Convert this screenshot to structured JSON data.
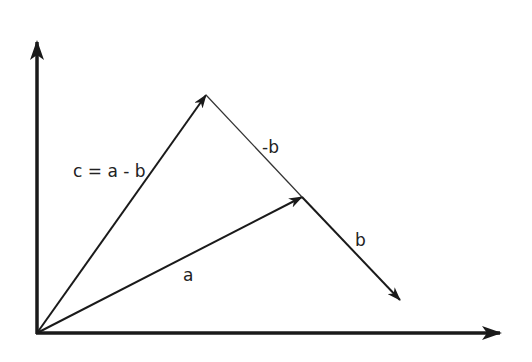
{
  "diagram": {
    "colors": {
      "stroke": "#1a1a1a",
      "background": "#ffffff"
    },
    "labels": {
      "c": "c = a - b",
      "neg_b": "-b",
      "b": "b",
      "a": "a"
    },
    "points": {
      "origin": [
        37,
        333
      ],
      "y_axis_tip": [
        37,
        42
      ],
      "x_axis_tip": [
        500,
        333
      ],
      "c_tip": [
        206,
        95
      ],
      "a_tip": [
        302,
        197
      ],
      "b_tip": [
        400,
        300
      ]
    },
    "vectors": [
      {
        "name": "x-axis",
        "from": "origin",
        "to": "x_axis_tip"
      },
      {
        "name": "y-axis",
        "from": "origin",
        "to": "y_axis_tip"
      },
      {
        "name": "a",
        "from": "origin",
        "to": "a_tip"
      },
      {
        "name": "c",
        "from": "origin",
        "to": "c_tip"
      },
      {
        "name": "-b",
        "from": "a_tip",
        "to": "c_tip"
      },
      {
        "name": "b",
        "from": "a_tip",
        "to": "b_tip"
      }
    ]
  }
}
